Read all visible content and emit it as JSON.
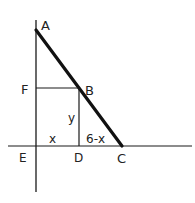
{
  "diagram": {
    "points": {
      "A": "A",
      "B": "B",
      "C": "C",
      "D": "D",
      "E": "E",
      "F": "F"
    },
    "segment_labels": {
      "ED": "x",
      "DC": "6-x",
      "BD": "y"
    },
    "colors": {
      "stroke": "#1a1a1a",
      "background": "#ffffff"
    }
  }
}
